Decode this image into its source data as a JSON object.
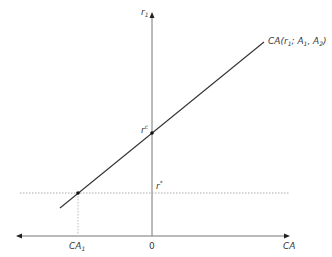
{
  "diagram": {
    "type": "economics-current-account",
    "axes": {
      "y_label": "r",
      "y_label_sub": "1",
      "x_label": "CA",
      "origin_label": "0"
    },
    "curve": {
      "label_main": "CA(r",
      "label_sub1": "1",
      "label_sep": "; A",
      "label_sub2": "1",
      "label_sep2": ", A",
      "label_sub3": "2",
      "label_close": ")"
    },
    "points": {
      "rc_label": "r",
      "rc_sup": "c",
      "rstar_label": "r",
      "rstar_sup": "*",
      "ca1_label": "CA",
      "ca1_sub": "1"
    },
    "colors": {
      "axis": "#777777",
      "curve": "#333333",
      "dotted": "#aaaaaa",
      "text": "#3a3a3a"
    }
  }
}
